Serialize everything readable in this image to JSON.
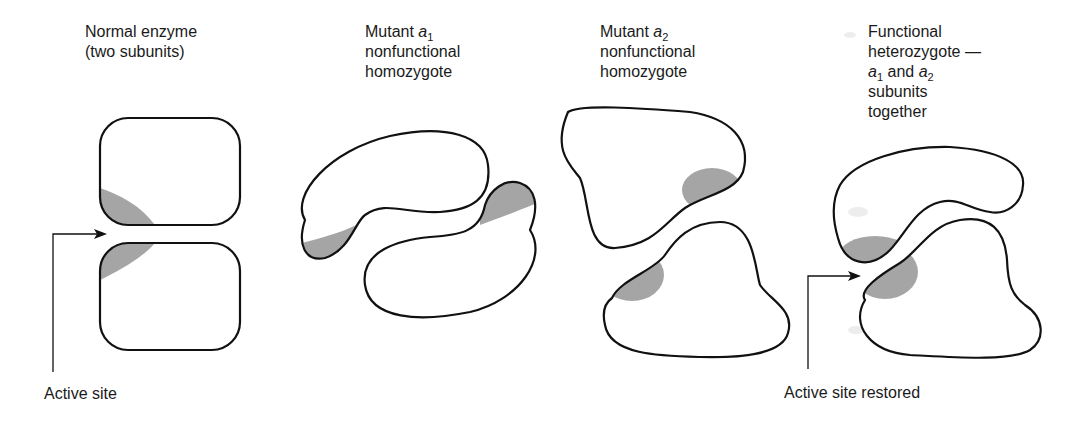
{
  "panels": [
    {
      "id": "normal",
      "title_line1": "Normal enzyme",
      "title_line2": "(two subunits)"
    },
    {
      "id": "mutant-a1",
      "title_prefix": "Mutant ",
      "title_allele": "a",
      "title_subscript": "1",
      "title_line2": "nonfunctional",
      "title_line3": "homozygote"
    },
    {
      "id": "mutant-a2",
      "title_prefix": "Mutant ",
      "title_allele": "a",
      "title_subscript": "2",
      "title_line2": "nonfunctional",
      "title_line3": "homozygote"
    },
    {
      "id": "heterozygote",
      "title_line1": "Functional",
      "title_line2": "heterozygote —",
      "title_allele1": "a",
      "title_sub1": "1",
      "title_mid": " and ",
      "title_allele2": "a",
      "title_sub2": "2",
      "title_line4": "subunits",
      "title_line5": "together"
    }
  ],
  "callouts": {
    "active_site": "Active site",
    "active_site_restored": "Active site restored"
  },
  "colors": {
    "outline": "#111111",
    "active_site_fill": "#a5a5a5",
    "background": "#ffffff"
  }
}
